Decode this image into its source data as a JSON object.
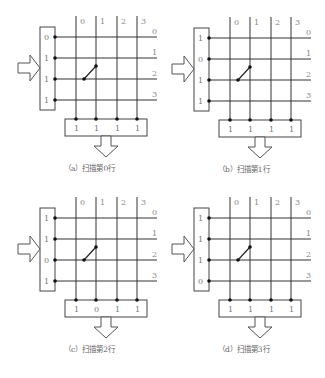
{
  "figure": {
    "panels": [
      {
        "id": "a",
        "caption": "（a）扫描第0行",
        "origin": [
          0,
          0
        ],
        "row_outputs": [
          "0",
          "1",
          "1",
          "1"
        ],
        "col_inputs": [
          "1",
          "1",
          "1",
          "1"
        ]
      },
      {
        "id": "b",
        "caption": "（b）扫描第1行",
        "origin": [
          154,
          1
        ],
        "row_outputs": [
          "1",
          "0",
          "1",
          "1"
        ],
        "col_inputs": [
          "1",
          "1",
          "1",
          "1"
        ]
      },
      {
        "id": "c",
        "caption": "（c）扫描第2行",
        "origin": [
          0,
          181
        ],
        "row_outputs": [
          "1",
          "1",
          "0",
          "1"
        ],
        "col_inputs": [
          "1",
          "0",
          "1",
          "1"
        ]
      },
      {
        "id": "d",
        "caption": "（d）扫描第3行",
        "origin": [
          154,
          181
        ],
        "row_outputs": [
          "1",
          "1",
          "1",
          "0"
        ],
        "col_inputs": [
          "1",
          "1",
          "1",
          "1"
        ]
      }
    ],
    "column_labels": [
      "0",
      "1",
      "2",
      "3"
    ],
    "row_labels": [
      "0",
      "1",
      "2",
      "3"
    ],
    "pressed_key": {
      "row": 2,
      "col": 1
    },
    "colors": {
      "line": "#333333",
      "label": "#888888",
      "background": "#ffffff"
    }
  }
}
